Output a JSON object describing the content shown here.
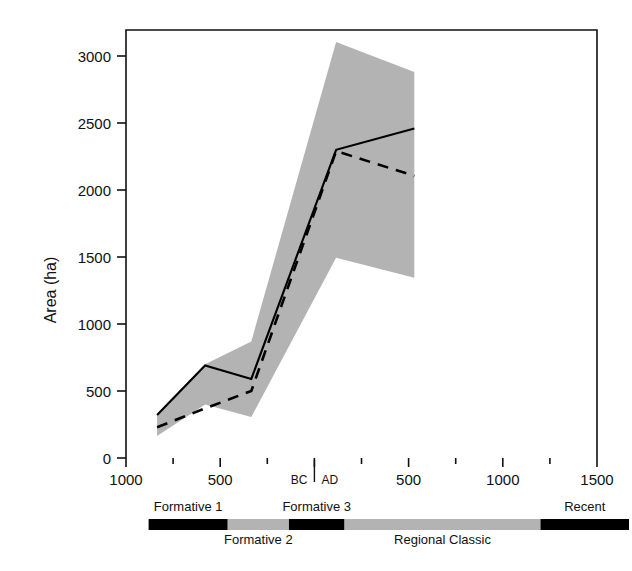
{
  "chart_data": {
    "type": "line",
    "title": "",
    "subtitle": "",
    "xlabel": "",
    "ylabel": "Area (ha)",
    "xlim": [
      -1000,
      1500
    ],
    "ylim": [
      0,
      3150
    ],
    "grid": false,
    "legend_position": "none",
    "x_tick_values": [
      -1000,
      -750,
      -500,
      -250,
      0,
      250,
      500,
      750,
      1000,
      1250,
      1500
    ],
    "x_tick_labels": [
      "1000",
      "",
      "500",
      "",
      "BC|AD",
      "",
      "500",
      "",
      "1000",
      "",
      "1500"
    ],
    "x_tick_major_labels": [
      "1000",
      "500",
      "BC",
      "AD",
      "500",
      "1000",
      "1500"
    ],
    "y_tick_values": [
      0,
      500,
      1000,
      1500,
      2000,
      2500,
      3000
    ],
    "y_tick_labels": [
      "0",
      "500",
      "1000",
      "1500",
      "2000",
      "2500",
      "3000"
    ],
    "era_divider_year": 0,
    "era_labels": {
      "before": "BC",
      "after": "AD"
    },
    "x": [
      -835,
      -580,
      -335,
      115,
      530
    ],
    "series": [
      {
        "name": "Maximum estimate",
        "style": "solid",
        "color": "#000000",
        "values": [
          320,
          690,
          590,
          2300,
          2460
        ]
      },
      {
        "name": "Minimum estimate",
        "style": "dashed",
        "color": "#000000",
        "values": [
          230,
          370,
          500,
          2290,
          2105
        ]
      }
    ],
    "band": {
      "name": "Estimate range",
      "color": "#b3b3b3",
      "upper": [
        330,
        700,
        870,
        3105,
        2880
      ],
      "lower": [
        165,
        400,
        305,
        1495,
        1345
      ]
    },
    "periods": [
      {
        "label": "Formative 1",
        "start": -880,
        "end": -460,
        "color": "#000000",
        "label_position": "above"
      },
      {
        "label": "Formative 2",
        "start": -460,
        "end": -135,
        "color": "#b3b3b3",
        "label_position": "below"
      },
      {
        "label": "Formative 3",
        "start": -135,
        "end": 160,
        "color": "#000000",
        "label_position": "above"
      },
      {
        "label": "Regional Classic",
        "start": 160,
        "end": 1200,
        "color": "#b3b3b3",
        "label_position": "below"
      },
      {
        "label": "Recent",
        "start": 1200,
        "end": 1670,
        "color": "#000000",
        "label_position": "above"
      }
    ]
  },
  "axis": {
    "y_title": "Area (ha)"
  }
}
